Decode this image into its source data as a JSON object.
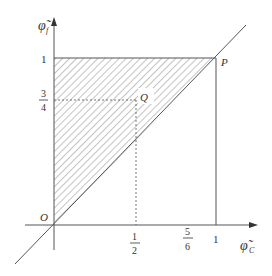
{
  "diagram": {
    "title": "",
    "axes": {
      "x_label": "φ̃",
      "x_sub": "C",
      "y_label": "φ̃",
      "y_sub": "f"
    },
    "points": {
      "origin": "O",
      "p": "P",
      "q": "Q"
    },
    "x_ticks": [
      {
        "num": "1",
        "den": "2",
        "value": 0.5
      },
      {
        "num": "5",
        "den": "6",
        "value": 0.8333
      },
      {
        "label": "1",
        "value": 1
      }
    ],
    "y_ticks": [
      {
        "label": "1",
        "value": 1
      },
      {
        "num": "3",
        "den": "4",
        "value": 0.75
      }
    ],
    "shaded_region": "triangle O-(0,1)-P hatched above diagonal",
    "colors": {
      "line": "#555555",
      "hatch": "#8a8a8a",
      "text": "#333333"
    }
  }
}
